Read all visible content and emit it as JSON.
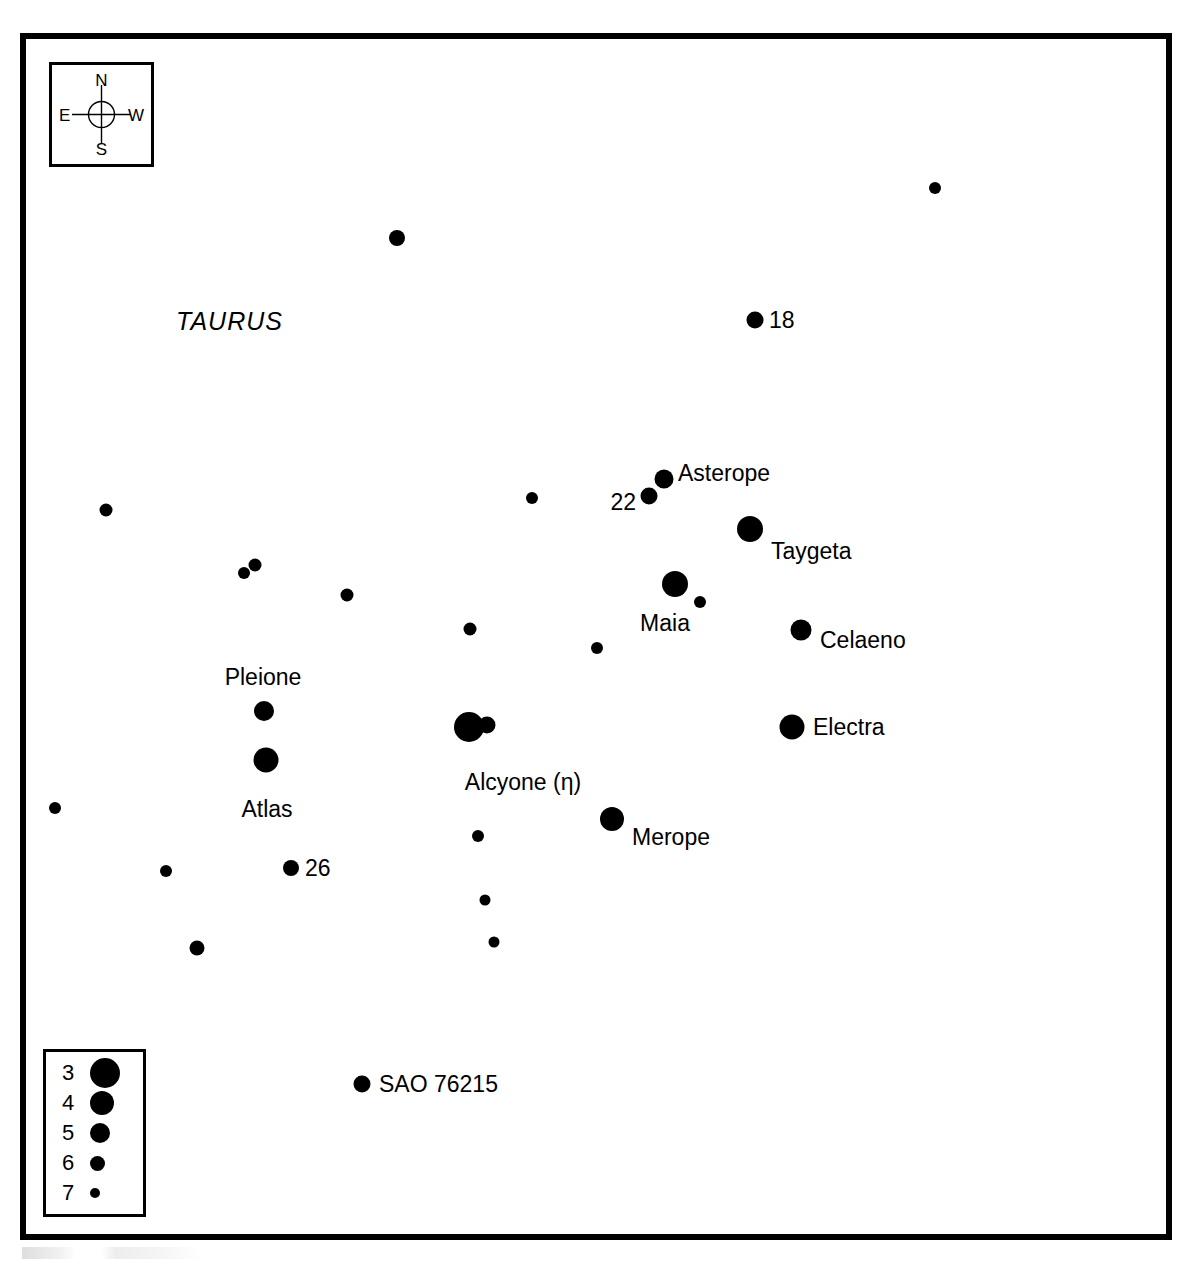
{
  "chart_data": {
    "type": "scatter",
    "xlabel": "",
    "ylabel": "",
    "grid": false,
    "legend_position": "bottom-left",
    "axis_note": "Positions given in pixel coordinates of the chart frame; sky orientation North up, East left",
    "constellation": "TAURUS",
    "magnitude_legend": {
      "title": "",
      "entries": [
        {
          "magnitude": "3",
          "dot_px": 30
        },
        {
          "magnitude": "4",
          "dot_px": 24
        },
        {
          "magnitude": "5",
          "dot_px": 20
        },
        {
          "magnitude": "6",
          "dot_px": 15
        },
        {
          "magnitude": "7",
          "dot_px": 10
        }
      ]
    },
    "compass": {
      "north": "N",
      "south": "S",
      "east": "E",
      "west": "W"
    },
    "stars": [
      {
        "label": "Alcyone (η)",
        "mag": 3,
        "x": 443,
        "y": 688,
        "size": 30,
        "label_pos": "below",
        "label_dx": 54,
        "label_dy": 44
      },
      {
        "label": "",
        "mag": 5,
        "x": 461,
        "y": 686,
        "size": 17,
        "label_pos": "none",
        "label_dx": 0,
        "label_dy": 0
      },
      {
        "label": "Atlas",
        "mag": 3,
        "x": 240,
        "y": 721,
        "size": 25,
        "label_pos": "below",
        "label_dx": 1,
        "label_dy": 38
      },
      {
        "label": "Electra",
        "mag": 3,
        "x": 766,
        "y": 688,
        "size": 25,
        "label_pos": "right",
        "label_dx": 21,
        "label_dy": 0
      },
      {
        "label": "Maia",
        "mag": 3,
        "x": 649,
        "y": 545,
        "size": 26,
        "label_pos": "below",
        "label_dx": -10,
        "label_dy": 28
      },
      {
        "label": "Merope",
        "mag": 3,
        "x": 586,
        "y": 780,
        "size": 24,
        "label_pos": "right",
        "label_dx": 20,
        "label_dy": 18
      },
      {
        "label": "Taygeta",
        "mag": 3,
        "x": 724,
        "y": 490,
        "size": 26,
        "label_pos": "right",
        "label_dx": 21,
        "label_dy": 22
      },
      {
        "label": "Celaeno",
        "mag": 4,
        "x": 775,
        "y": 591,
        "size": 21,
        "label_pos": "right",
        "label_dx": 19,
        "label_dy": 10
      },
      {
        "label": "Pleione",
        "mag": 4,
        "x": 238,
        "y": 672,
        "size": 20,
        "label_pos": "above",
        "label_dx": -1,
        "label_dy": -22
      },
      {
        "label": "Asterope",
        "mag": 4,
        "x": 638,
        "y": 440,
        "size": 19,
        "label_pos": "right",
        "label_dx": 14,
        "label_dy": -6
      },
      {
        "label": "22",
        "mag": 5,
        "x": 623,
        "y": 457,
        "size": 17,
        "label_pos": "left",
        "label_dx": -13,
        "label_dy": 6
      },
      {
        "label": "18",
        "mag": 5,
        "x": 729,
        "y": 281,
        "size": 17,
        "label_pos": "right",
        "label_dx": 14,
        "label_dy": 0
      },
      {
        "label": "26",
        "mag": 5,
        "x": 265,
        "y": 829,
        "size": 16,
        "label_pos": "right",
        "label_dx": 14,
        "label_dy": 0
      },
      {
        "label": "SAO 76215",
        "mag": 5,
        "x": 336,
        "y": 1045,
        "size": 17,
        "label_pos": "right",
        "label_dx": 17,
        "label_dy": 0
      },
      {
        "label": "",
        "mag": 5,
        "x": 371,
        "y": 199,
        "size": 16,
        "label_pos": "none",
        "label_dx": 0,
        "label_dy": 0
      },
      {
        "label": "",
        "mag": 6,
        "x": 909,
        "y": 149,
        "size": 12,
        "label_pos": "none",
        "label_dx": 0,
        "label_dy": 0
      },
      {
        "label": "",
        "mag": 6,
        "x": 80,
        "y": 471,
        "size": 13,
        "label_pos": "none",
        "label_dx": 0,
        "label_dy": 0
      },
      {
        "label": "",
        "mag": 6,
        "x": 506,
        "y": 459,
        "size": 12,
        "label_pos": "none",
        "label_dx": 0,
        "label_dy": 0
      },
      {
        "label": "",
        "mag": 6,
        "x": 218,
        "y": 534,
        "size": 12,
        "label_pos": "none",
        "label_dx": 0,
        "label_dy": 0
      },
      {
        "label": "",
        "mag": 6,
        "x": 229,
        "y": 526,
        "size": 13,
        "label_pos": "none",
        "label_dx": 0,
        "label_dy": 0
      },
      {
        "label": "",
        "mag": 6,
        "x": 321,
        "y": 556,
        "size": 13,
        "label_pos": "none",
        "label_dx": 0,
        "label_dy": 0
      },
      {
        "label": "",
        "mag": 6,
        "x": 444,
        "y": 590,
        "size": 13,
        "label_pos": "none",
        "label_dx": 0,
        "label_dy": 0
      },
      {
        "label": "",
        "mag": 6,
        "x": 571,
        "y": 609,
        "size": 12,
        "label_pos": "none",
        "label_dx": 0,
        "label_dy": 0
      },
      {
        "label": "",
        "mag": 6,
        "x": 674,
        "y": 563,
        "size": 12,
        "label_pos": "none",
        "label_dx": 0,
        "label_dy": 0
      },
      {
        "label": "",
        "mag": 6,
        "x": 29,
        "y": 769,
        "size": 12,
        "label_pos": "none",
        "label_dx": 0,
        "label_dy": 0
      },
      {
        "label": "",
        "mag": 6,
        "x": 140,
        "y": 832,
        "size": 12,
        "label_pos": "none",
        "label_dx": 0,
        "label_dy": 0
      },
      {
        "label": "",
        "mag": 5,
        "x": 171,
        "y": 909,
        "size": 15,
        "label_pos": "none",
        "label_dx": 0,
        "label_dy": 0
      },
      {
        "label": "",
        "mag": 6,
        "x": 452,
        "y": 797,
        "size": 12,
        "label_pos": "none",
        "label_dx": 0,
        "label_dy": 0
      },
      {
        "label": "",
        "mag": 7,
        "x": 459,
        "y": 861,
        "size": 11,
        "label_pos": "none",
        "label_dx": 0,
        "label_dy": 0
      },
      {
        "label": "",
        "mag": 7,
        "x": 468,
        "y": 903,
        "size": 11,
        "label_pos": "none",
        "label_dx": 0,
        "label_dy": 0
      }
    ]
  }
}
